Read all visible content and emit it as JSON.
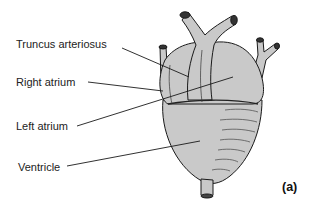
{
  "figure": {
    "panel_label": "(a)",
    "labels": [
      {
        "id": "truncus",
        "text": "Truncus arteriosus"
      },
      {
        "id": "right_atrium",
        "text": "Right atrium"
      },
      {
        "id": "left_atrium",
        "text": "Left atrium"
      },
      {
        "id": "ventricle",
        "text": "Ventricle"
      }
    ]
  },
  "colors": {
    "fill": "#c9c9c9",
    "outline": "#1a1a1a",
    "text": "#222222"
  }
}
